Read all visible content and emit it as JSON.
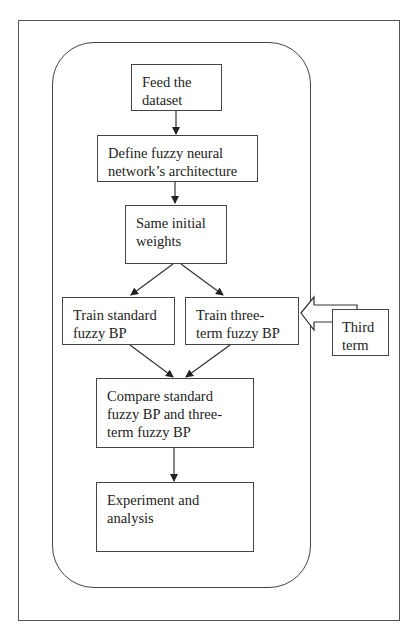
{
  "diagram": {
    "type": "flowchart",
    "nodes": [
      {
        "id": "feed",
        "label": "Feed the dataset",
        "lines": [
          "Feed the",
          "dataset"
        ]
      },
      {
        "id": "define",
        "label": "Define fuzzy neural network's architecture",
        "lines": [
          "Define fuzzy neural",
          "network’s architecture"
        ]
      },
      {
        "id": "weights",
        "label": "Same initial weights",
        "lines": [
          "Same initial",
          "weights"
        ]
      },
      {
        "id": "train_std",
        "label": "Train standard fuzzy BP",
        "lines": [
          "Train standard",
          "fuzzy BP"
        ]
      },
      {
        "id": "train_three",
        "label": "Train three-term fuzzy BP",
        "lines": [
          "Train three-",
          "term fuzzy BP"
        ]
      },
      {
        "id": "third",
        "label": "Third term",
        "lines": [
          "Third",
          "term"
        ]
      },
      {
        "id": "compare",
        "label": "Compare standard fuzzy BP and three-term fuzzy BP",
        "lines": [
          "Compare standard",
          "fuzzy BP and three-",
          "term fuzzy BP"
        ]
      },
      {
        "id": "experiment",
        "label": "Experiment and analysis",
        "lines": [
          "Experiment and",
          "analysis"
        ]
      }
    ],
    "edges": [
      {
        "from": "feed",
        "to": "define"
      },
      {
        "from": "define",
        "to": "weights"
      },
      {
        "from": "weights",
        "to": "train_std"
      },
      {
        "from": "weights",
        "to": "train_three"
      },
      {
        "from": "third",
        "to": "train_three",
        "style": "block-arrow"
      },
      {
        "from": "train_std",
        "to": "compare"
      },
      {
        "from": "train_three",
        "to": "compare"
      },
      {
        "from": "compare",
        "to": "experiment"
      }
    ]
  }
}
